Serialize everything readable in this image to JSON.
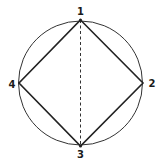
{
  "diagram": {
    "circle": {
      "cx": 80.5,
      "cy": 83,
      "r": 62
    },
    "vertices": [
      {
        "id": "1",
        "label": "1",
        "x": 80.5,
        "y": 20
      },
      {
        "id": "2",
        "label": "2",
        "x": 143,
        "y": 83
      },
      {
        "id": "3",
        "label": "3",
        "x": 80.5,
        "y": 146
      },
      {
        "id": "4",
        "label": "4",
        "x": 19,
        "y": 83
      }
    ],
    "edges": [
      {
        "from": "1",
        "to": "2",
        "style": "solid"
      },
      {
        "from": "2",
        "to": "3",
        "style": "solid"
      },
      {
        "from": "3",
        "to": "4",
        "style": "solid"
      },
      {
        "from": "4",
        "to": "1",
        "style": "solid"
      },
      {
        "from": "1",
        "to": "3",
        "style": "dashed"
      }
    ],
    "stroke_color": "#222222"
  }
}
